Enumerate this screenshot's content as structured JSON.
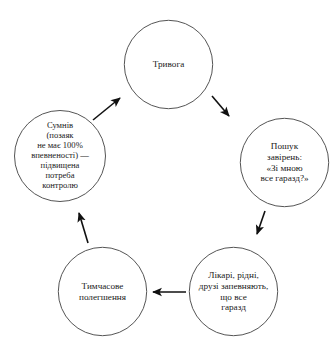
{
  "diagram": {
    "type": "cycle",
    "direction": "counterclockwise",
    "stroke_color": "#555555",
    "text_color": "#1a1a1a",
    "background_color": "#ffffff",
    "nodes": [
      {
        "id": "anxiety",
        "label": "Тривога",
        "position": "top"
      },
      {
        "id": "reassurance-seeking",
        "label": "Пошук\nзавірень:\n«Зі мною\nвсе гаразд?»",
        "position": "right"
      },
      {
        "id": "others-reassure",
        "label": "Лікарі, рідні,\nдрузі запевняють,\nщо все\nгаразд",
        "position": "bottom-right"
      },
      {
        "id": "temporary-relief",
        "label": "Тимчасове\nполегшення",
        "position": "bottom-left"
      },
      {
        "id": "doubt",
        "label": "Сумнів\n(позаяк\nне має 100%\nвпевненості) —\nпідвищена\nпотреба\nконтролю",
        "position": "left"
      }
    ],
    "arrows": [
      {
        "id": "arrow-anxiety-to-reassurance-seeking",
        "from": "anxiety",
        "to": "reassurance-seeking"
      },
      {
        "id": "arrow-reassurance-seeking-to-others-reassure",
        "from": "reassurance-seeking",
        "to": "others-reassure"
      },
      {
        "id": "arrow-others-reassure-to-temporary-relief",
        "from": "others-reassure",
        "to": "temporary-relief"
      },
      {
        "id": "arrow-temporary-relief-to-doubt",
        "from": "temporary-relief",
        "to": "doubt"
      },
      {
        "id": "arrow-doubt-to-anxiety",
        "from": "doubt",
        "to": "anxiety"
      }
    ]
  }
}
